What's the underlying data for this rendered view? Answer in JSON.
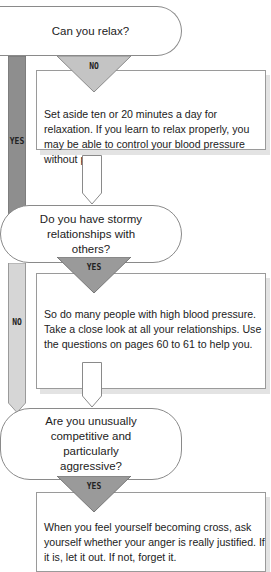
{
  "flowchart": {
    "nodes": [
      {
        "question": "Can you relax?",
        "branch_down": "NO",
        "branch_side": "YES",
        "answer": "Set aside ten or 20 minutes a day for relaxation. If you learn to relax properly, you may be able to control your blood pressure without pills."
      },
      {
        "question": "Do you have stormy relationships with others?",
        "branch_down": "YES",
        "branch_side": "NO",
        "answer": "So do many people with high blood pressure. Take a close look at all your relationships. Use the questions on pages 60 to 61 to help you."
      },
      {
        "question": "Are you unusually competitive and particularly aggressive?",
        "branch_down": "YES",
        "answer": "When you feel yourself becoming cross, ask yourself whether your anger is really justified. If it is, let it out. If not, forget it."
      }
    ]
  },
  "colors": {
    "yes_bar": "#8e8e8e",
    "no_bar": "#d6d6d6",
    "triangle_dark": "#9a9a9a",
    "triangle_light": "#c4c4c4",
    "outline": "#8a8a8a"
  }
}
